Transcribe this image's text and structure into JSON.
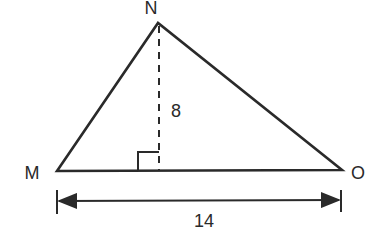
{
  "diagram": {
    "type": "triangle",
    "vertices": {
      "N": {
        "label": "N",
        "x": 158,
        "y": 23
      },
      "M": {
        "label": "M",
        "x": 57,
        "y": 171
      },
      "O": {
        "label": "O",
        "x": 342,
        "y": 170
      }
    },
    "altitude": {
      "label": "8",
      "from": "N",
      "foot_x": 159,
      "style": "dashed"
    },
    "base_dimension": {
      "label": "14",
      "from": "M",
      "to": "O"
    },
    "right_angle_marker": true,
    "colors": {
      "stroke": "#2a2a2a",
      "background": "#ffffff"
    }
  }
}
